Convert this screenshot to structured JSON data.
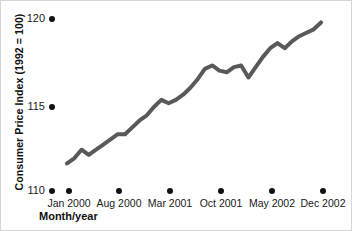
{
  "chart_data": {
    "type": "line",
    "title": "",
    "xlabel": "Month/year",
    "ylabel": "Consumer Price Index (1992 = 100)",
    "ylim": [
      110,
      120
    ],
    "yticks": [
      110,
      115,
      120
    ],
    "ytick_labels": [
      "110",
      "115",
      "120"
    ],
    "xtick_labels": [
      "Jan 2000",
      "Aug 2000",
      "Mar 2001",
      "Oct 2001",
      "May 2002",
      "Dec 2002"
    ],
    "xlim": [
      "Jan 2000",
      "Dec 2002"
    ],
    "grid": false,
    "legend": false,
    "line_color": "#595959",
    "line_width": 4,
    "x": [
      "Jan 2000",
      "Feb 2000",
      "Mar 2000",
      "Apr 2000",
      "May 2000",
      "Jun 2000",
      "Jul 2000",
      "Aug 2000",
      "Sep 2000",
      "Oct 2000",
      "Nov 2000",
      "Dec 2000",
      "Jan 2001",
      "Feb 2001",
      "Mar 2001",
      "Apr 2001",
      "May 2001",
      "Jun 2001",
      "Jul 2001",
      "Aug 2001",
      "Sep 2001",
      "Oct 2001",
      "Nov 2001",
      "Dec 2001",
      "Jan 2002",
      "Feb 2002",
      "Mar 2002",
      "Apr 2002",
      "May 2002",
      "Jun 2002",
      "Jul 2002",
      "Aug 2002",
      "Sep 2002",
      "Oct 2002",
      "Nov 2002",
      "Dec 2002"
    ],
    "values": [
      111.6,
      111.9,
      112.4,
      112.1,
      112.4,
      112.7,
      113.0,
      113.3,
      113.3,
      113.7,
      114.1,
      114.4,
      114.9,
      115.3,
      115.1,
      115.3,
      115.6,
      116.0,
      116.5,
      117.1,
      117.3,
      117.0,
      116.9,
      117.2,
      117.3,
      116.6,
      117.2,
      117.8,
      118.3,
      118.6,
      118.3,
      118.7,
      119.0,
      119.2,
      119.4,
      119.8
    ],
    "series_name": "Consumer Price Index"
  },
  "axis": {
    "ylabel_text": "Consumer Price Index (1992 = 100)",
    "xlabel_text": "Month/year"
  }
}
